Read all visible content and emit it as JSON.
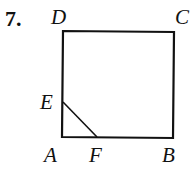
{
  "problem": {
    "number": "7."
  },
  "figure": {
    "type": "square",
    "vertices": [
      {
        "name": "A",
        "x": 62,
        "y": 137
      },
      {
        "name": "B",
        "x": 173,
        "y": 138
      },
      {
        "name": "C",
        "x": 174,
        "y": 32
      },
      {
        "name": "D",
        "x": 63,
        "y": 31
      }
    ],
    "points": [
      {
        "name": "E",
        "x": 63,
        "y": 102,
        "on": "AD"
      },
      {
        "name": "F",
        "x": 97,
        "y": 137,
        "on": "AB"
      }
    ],
    "segments": [
      "AB",
      "BC",
      "CD",
      "DA",
      "EF"
    ],
    "labels": {
      "A": "A",
      "B": "B",
      "C": "C",
      "D": "D",
      "E": "E",
      "F": "F"
    }
  }
}
